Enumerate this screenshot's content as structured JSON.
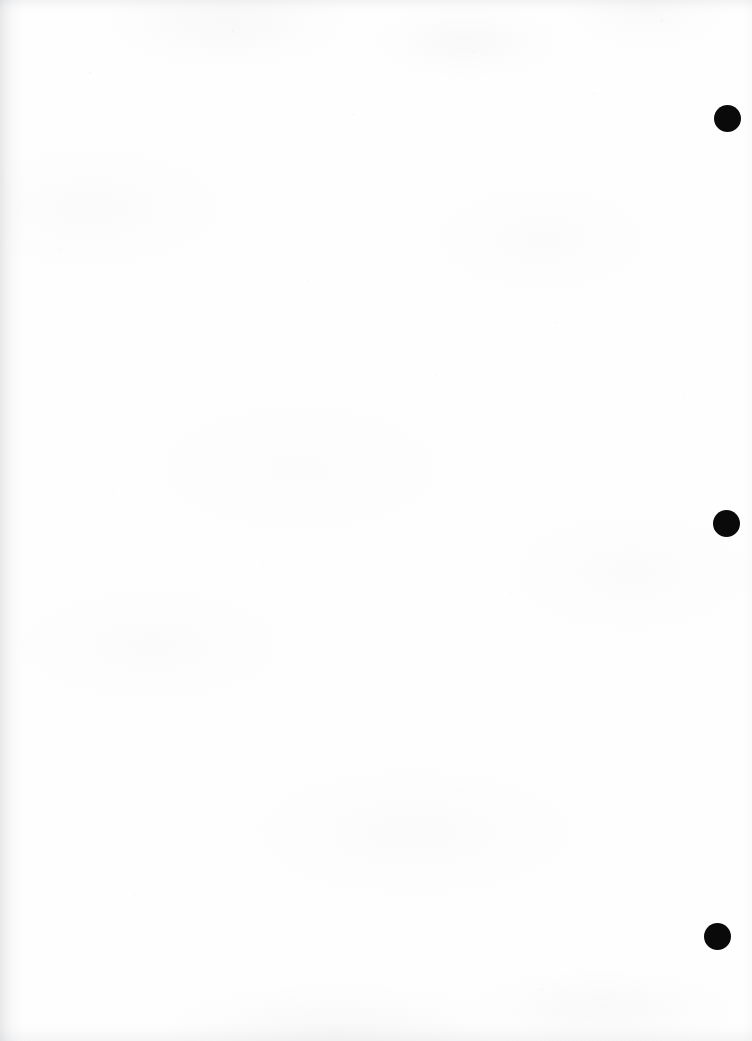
{
  "page": {
    "kind": "scanned-document-page",
    "width": 752,
    "height": 1041,
    "paper_color": "#fefefe",
    "ink_color": "#0a0a0a",
    "shadow_color": "#8a8c94"
  },
  "punch_marks": [
    {
      "id": "punch-1",
      "label": "",
      "x": 714,
      "y": 105,
      "diameter": 27
    },
    {
      "id": "punch-2",
      "label": "",
      "x": 713,
      "y": 510,
      "diameter": 27
    },
    {
      "id": "punch-3",
      "label": "",
      "x": 704,
      "y": 923,
      "diameter": 27
    }
  ],
  "ghost_text": {
    "header": {
      "line1": "",
      "line2": ""
    },
    "margin_mid": {
      "line1": "",
      "line2": ""
    },
    "margin_lower": {
      "line1": "",
      "line2": ""
    }
  }
}
